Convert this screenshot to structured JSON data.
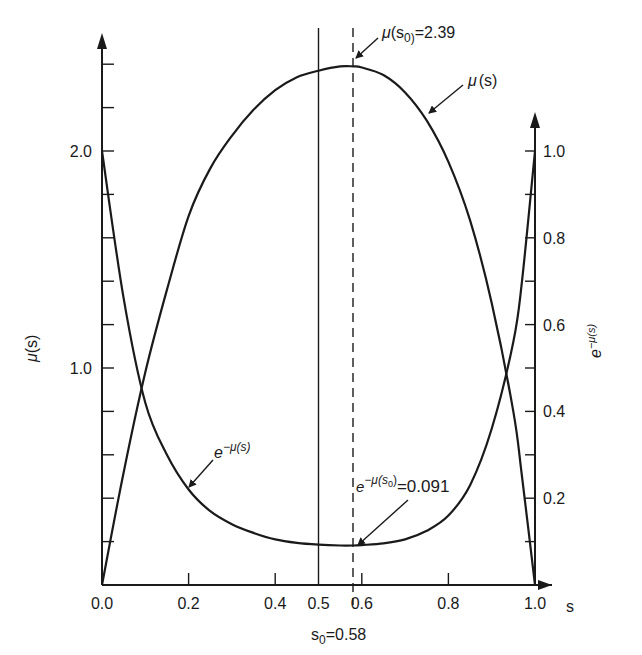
{
  "chart_data": {
    "type": "line",
    "title": "",
    "xlabel": "s",
    "ylabel": "μ(s)",
    "y2label": "e^{-μ(s)}",
    "xlim": [
      0.0,
      1.0
    ],
    "ylim": [
      0.0,
      2.5
    ],
    "y2lim": [
      0.0,
      1.1
    ],
    "grid": false,
    "legend": "none (curves labeled by arrows)",
    "x_ticks": [
      0.0,
      0.2,
      0.4,
      0.5,
      0.6,
      0.8,
      1.0
    ],
    "x_tick_labels": [
      "0.0",
      "0.2",
      "0.4",
      "0.5",
      "0.6",
      "0.8",
      "1.0"
    ],
    "y_ticks_labeled": [
      1.0,
      2.0
    ],
    "y_tick_labels": [
      "1.0",
      "2.0"
    ],
    "y_minor_tick_step": 0.2,
    "y2_ticks_labeled": [
      0.2,
      0.4,
      0.6,
      0.8,
      1.0
    ],
    "y2_tick_labels": [
      "0.2",
      "0.4",
      "0.6",
      "0.8",
      "1.0"
    ],
    "y2_minor_tick_step": 0.1,
    "x": [
      0.0,
      0.05,
      0.1,
      0.15,
      0.2,
      0.25,
      0.3,
      0.35,
      0.4,
      0.45,
      0.5,
      0.55,
      0.58,
      0.6,
      0.65,
      0.7,
      0.75,
      0.8,
      0.85,
      0.9,
      0.95,
      0.97,
      1.0
    ],
    "series": [
      {
        "name": "μ(s)",
        "axis": "left",
        "values": [
          0.0,
          0.52,
          0.98,
          1.36,
          1.7,
          1.92,
          2.07,
          2.19,
          2.28,
          2.34,
          2.37,
          2.39,
          2.39,
          2.385,
          2.35,
          2.27,
          2.14,
          1.95,
          1.68,
          1.3,
          0.8,
          0.5,
          0.0
        ]
      },
      {
        "name": "e^{-μ(s)}",
        "axis": "right",
        "values": [
          1.0,
          0.66,
          0.42,
          0.3,
          0.22,
          0.17,
          0.14,
          0.12,
          0.105,
          0.097,
          0.093,
          0.091,
          0.091,
          0.092,
          0.096,
          0.105,
          0.125,
          0.16,
          0.23,
          0.36,
          0.56,
          0.7,
          1.0
        ]
      }
    ],
    "reference_lines": [
      {
        "type": "vertical",
        "x": 0.5,
        "style": "solid"
      },
      {
        "type": "vertical",
        "x": 0.58,
        "style": "dashed"
      }
    ],
    "annotations": [
      {
        "text": "μ(s0)=2.39",
        "x": 0.58,
        "y": 2.39,
        "axis": "left"
      },
      {
        "text": "μ(s)",
        "x": 0.74,
        "y": 2.1,
        "axis": "left"
      },
      {
        "text": "e^{-μ(s)}",
        "x": 0.19,
        "y": 0.23,
        "axis": "right"
      },
      {
        "text": "e^{-μ(s0)}=0.091",
        "x": 0.58,
        "y": 0.091,
        "axis": "right"
      },
      {
        "text": "s0=0.58",
        "x": 0.58,
        "position": "below x-axis"
      }
    ]
  },
  "labels": {
    "x_axis": "s",
    "y_left_main": "μ",
    "y_left_paren": "(s)",
    "y_right_e": "e",
    "y_right_exp": "−μ(s)",
    "mu_peak_mu": "μ",
    "mu_peak_s": "(s",
    "mu_peak_sub": "0)",
    "mu_peak_val": "=2.39",
    "mu_curve_mu": "μ",
    "mu_curve_paren": "(s)",
    "emu_curve_e": "e",
    "emu_curve_exp": "−μ(s)",
    "emu_min_e": "e",
    "emu_min_exp": "−μ(s",
    "emu_min_sub": "0",
    "emu_min_close": ")",
    "emu_min_val": "=0.091",
    "s0_s": "s",
    "s0_sub": "0",
    "s0_val": "=0.58"
  }
}
